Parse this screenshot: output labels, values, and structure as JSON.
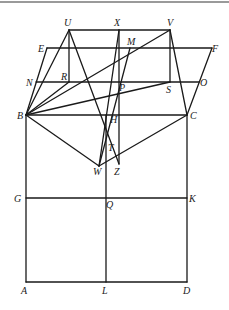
{
  "figure": {
    "type": "geometric construction diagram",
    "points": {
      "U": [
        69,
        30
      ],
      "X": [
        119,
        30
      ],
      "V": [
        170,
        30
      ],
      "E": [
        47,
        48
      ],
      "M": [
        130,
        48
      ],
      "F": [
        212,
        48
      ],
      "N": [
        36,
        82
      ],
      "R": [
        69,
        82
      ],
      "P": [
        117,
        82
      ],
      "S": [
        170,
        82
      ],
      "O": [
        199,
        82
      ],
      "B": [
        26,
        115
      ],
      "H": [
        106,
        115
      ],
      "C": [
        187,
        115
      ],
      "T": [
        106,
        148
      ],
      "W": [
        99,
        166
      ],
      "Z": [
        119,
        164
      ],
      "G": [
        26,
        198
      ],
      "Q": [
        106,
        198
      ],
      "K": [
        187,
        198
      ],
      "A": [
        26,
        282
      ],
      "L": [
        106,
        282
      ],
      "D": [
        187,
        282
      ]
    },
    "labels": [
      {
        "text": "U",
        "x": 64,
        "y": 26
      },
      {
        "text": "X",
        "x": 114,
        "y": 26
      },
      {
        "text": "V",
        "x": 167,
        "y": 26
      },
      {
        "text": "E",
        "x": 38,
        "y": 52
      },
      {
        "text": "M",
        "x": 127,
        "y": 45
      },
      {
        "text": "F",
        "x": 212,
        "y": 52
      },
      {
        "text": "N",
        "x": 26,
        "y": 86
      },
      {
        "text": "R",
        "x": 61,
        "y": 80
      },
      {
        "text": "P",
        "x": 119,
        "y": 91
      },
      {
        "text": "S",
        "x": 166,
        "y": 93
      },
      {
        "text": "O",
        "x": 200,
        "y": 86
      },
      {
        "text": "B",
        "x": 17,
        "y": 119
      },
      {
        "text": "H",
        "x": 110,
        "y": 123
      },
      {
        "text": "C",
        "x": 190,
        "y": 119
      },
      {
        "text": "T",
        "x": 108,
        "y": 151
      },
      {
        "text": "W",
        "x": 93,
        "y": 175
      },
      {
        "text": "Z",
        "x": 114,
        "y": 175
      },
      {
        "text": "G",
        "x": 14,
        "y": 202
      },
      {
        "text": "Q",
        "x": 106,
        "y": 208
      },
      {
        "text": "K",
        "x": 189,
        "y": 202
      },
      {
        "text": "A",
        "x": 21,
        "y": 294
      },
      {
        "text": "L",
        "x": 102,
        "y": 294
      },
      {
        "text": "D",
        "x": 183,
        "y": 294
      }
    ],
    "segments": [
      [
        "U",
        "V"
      ],
      [
        "E",
        "F"
      ],
      [
        "N",
        "O"
      ],
      [
        "B",
        "C"
      ],
      [
        "G",
        "K"
      ],
      [
        "A",
        "D"
      ],
      [
        "B",
        "A"
      ],
      [
        "C",
        "D"
      ],
      [
        "H",
        "L"
      ],
      [
        "U",
        "R"
      ],
      [
        "V",
        "S"
      ],
      [
        "X",
        "Z"
      ],
      [
        "B",
        "E"
      ],
      [
        "C",
        "F"
      ],
      [
        "B",
        "U"
      ],
      [
        "B",
        "V"
      ],
      [
        "B",
        "R"
      ],
      [
        "B",
        "S"
      ],
      [
        "B",
        "W"
      ],
      [
        "C",
        "V"
      ],
      [
        "C",
        "W"
      ],
      [
        "U",
        "Z"
      ],
      [
        "X",
        "W"
      ],
      [
        "M",
        "W"
      ]
    ]
  }
}
